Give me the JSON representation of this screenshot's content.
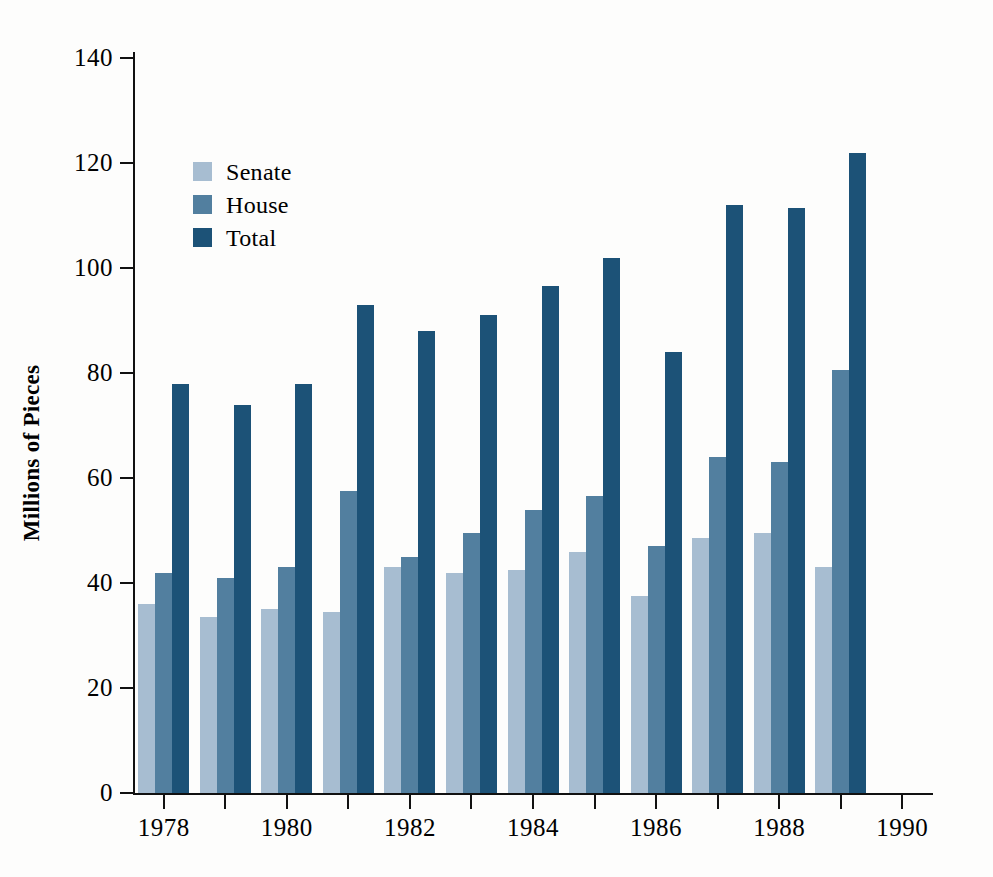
{
  "chart_data": {
    "type": "bar",
    "title": "",
    "xlabel": "",
    "ylabel": "Millions of Pieces",
    "categories": [
      "1978",
      "1979",
      "1980",
      "1981",
      "1982",
      "1983",
      "1984",
      "1985",
      "1986",
      "1987",
      "1988",
      "1989"
    ],
    "series": [
      {
        "name": "Senate",
        "color": "#a7bdd1",
        "values": [
          36,
          33.5,
          35,
          34.5,
          43,
          42,
          42.5,
          46,
          37.5,
          48.5,
          49.5,
          43
        ]
      },
      {
        "name": "House",
        "color": "#527f9f",
        "values": [
          42,
          41,
          43,
          57.5,
          45,
          49.5,
          54,
          56.5,
          47,
          64,
          63,
          80.5
        ]
      },
      {
        "name": "Total",
        "color": "#1c5277",
        "values": [
          78,
          74,
          78,
          93,
          88,
          91,
          96.5,
          102,
          84,
          112,
          111.5,
          122
        ]
      }
    ],
    "ylim": [
      0,
      140
    ],
    "yticks": [
      0,
      20,
      40,
      60,
      80,
      100,
      120,
      140
    ],
    "ytick_labels": [
      "0",
      "20",
      "40",
      "60",
      "80",
      "100",
      "120",
      "140"
    ],
    "xlim": [
      1977.5,
      1990.5
    ],
    "xticks": [
      1978,
      1979,
      1980,
      1981,
      1982,
      1983,
      1984,
      1985,
      1986,
      1987,
      1988,
      1989,
      1990
    ],
    "xtick_labels_shown": [
      "1978",
      "1980",
      "1982",
      "1984",
      "1986",
      "1988",
      "1990"
    ],
    "grid": false,
    "legend_position": "upper-left-inside"
  },
  "legend": {
    "items": [
      {
        "label": "Senate",
        "color": "#a7bdd1"
      },
      {
        "label": "House",
        "color": "#527f9f"
      },
      {
        "label": "Total",
        "color": "#1c5277"
      }
    ]
  },
  "axes": {
    "y_title": "Millions of Pieces"
  }
}
